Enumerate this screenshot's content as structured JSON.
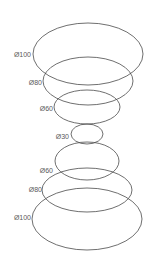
{
  "diagram": {
    "stroke_color": "#4a4a4a",
    "label_color": "#5a5a5a",
    "rings": [
      {
        "label": "Ø100",
        "cx": 88,
        "cy": 54,
        "rx": 55,
        "ry": 31,
        "lx": 31,
        "ly": 57
      },
      {
        "label": "Ø80",
        "cx": 88,
        "cy": 81,
        "rx": 45,
        "ry": 24,
        "lx": 42,
        "ly": 85
      },
      {
        "label": "Ø60",
        "cx": 87,
        "cy": 107,
        "rx": 33,
        "ry": 17,
        "lx": 53,
        "ly": 111
      },
      {
        "label": "Ø30",
        "cx": 87,
        "cy": 134,
        "rx": 16,
        "ry": 10,
        "lx": 69,
        "ly": 139
      },
      {
        "label": "Ø60",
        "cx": 87,
        "cy": 161,
        "rx": 32,
        "ry": 19,
        "lx": 53,
        "ly": 173
      },
      {
        "label": "Ø80",
        "cx": 87,
        "cy": 190,
        "rx": 45,
        "ry": 22,
        "lx": 42,
        "ly": 192
      },
      {
        "label": "Ø100",
        "cx": 87,
        "cy": 219,
        "rx": 55,
        "ry": 31,
        "lx": 31,
        "ly": 220
      }
    ]
  }
}
